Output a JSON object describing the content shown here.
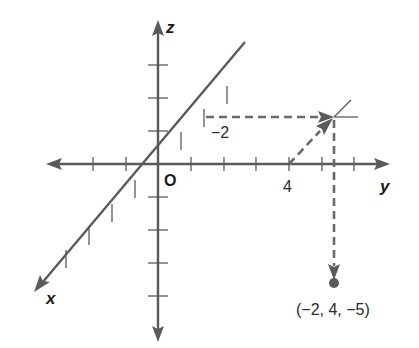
{
  "diagram": {
    "type": "3d-coordinate-system",
    "axes": {
      "x": {
        "label": "x"
      },
      "y": {
        "label": "y"
      },
      "z": {
        "label": "z"
      }
    },
    "origin_label": "O",
    "tick_labels": {
      "x_value": "−2",
      "y_value": "4"
    },
    "point": {
      "label": "(−2, 4, −5)",
      "coordinates": [
        -2,
        4,
        -5
      ]
    },
    "colors": {
      "axis": "#5a5a5a",
      "dashed": "#6a6a6a",
      "text": "#1a1a1a"
    }
  }
}
